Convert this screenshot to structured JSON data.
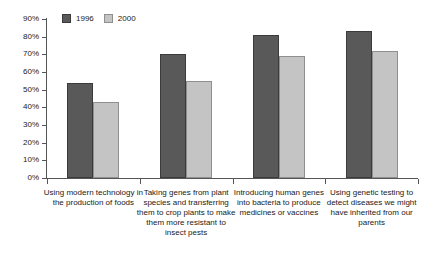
{
  "chart_data": {
    "type": "bar",
    "title": "",
    "subtitle": "",
    "xlabel": "",
    "ylabel": "",
    "ylim": [
      0,
      90
    ],
    "grid": false,
    "legend_position": "top-left",
    "ytick_labels": [
      "90%",
      "80%",
      "70%",
      "60%",
      "50%",
      "40%",
      "30%",
      "20%",
      "10%",
      "0%"
    ],
    "ytick_values": [
      90,
      80,
      70,
      60,
      50,
      40,
      30,
      20,
      10,
      0
    ],
    "categories": [
      "Using modern technology in the production of foods",
      "Taking genes from plant species and transferring them to crop plants to make them more resistant to insect pests",
      "Introducing human genes into bacteria to produce medicines or vaccines",
      "Using genetic testing to detect diseases we might have inherited from our parents"
    ],
    "series": [
      {
        "name": "1996",
        "color": "#595959",
        "values": [
          54,
          70,
          81,
          83
        ]
      },
      {
        "name": "2000",
        "color": "#c4c4c4",
        "values": [
          43,
          55,
          69,
          72
        ]
      }
    ]
  },
  "legend": {
    "entries": [
      {
        "label": "1996",
        "swatch": "dark-gray-swatch"
      },
      {
        "label": "2000",
        "swatch": "light-gray-swatch"
      }
    ]
  }
}
